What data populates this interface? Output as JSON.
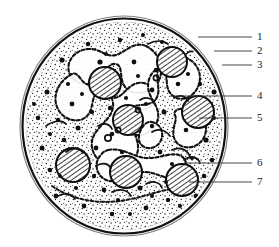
{
  "figure": {
    "kind": "cell-cross-section-diagram",
    "title_visible": false,
    "style": "black-and-white ink line drawing, stippled",
    "ink_color": "#1a1a1a",
    "background_color": "#ffffff"
  },
  "cell": {
    "shape": "circle",
    "center": {
      "x": 124,
      "y": 126
    },
    "radius_x": 104,
    "radius_y": 110,
    "membrane_layers": 3
  },
  "labels": [
    {
      "number": "1",
      "text_x": 259,
      "text_y": 32,
      "line_from_x": 198,
      "line_from_y": 37,
      "line_to_x": 252,
      "line_to_y": 37,
      "target": "outer-membrane"
    },
    {
      "number": "2",
      "text_x": 259,
      "text_y": 46,
      "line_from_x": 214,
      "line_from_y": 51,
      "line_to_x": 252,
      "line_to_y": 51,
      "target": "middle-membrane"
    },
    {
      "number": "3",
      "text_x": 259,
      "text_y": 60,
      "line_from_x": 222,
      "line_from_y": 65,
      "line_to_x": 252,
      "line_to_y": 65,
      "target": "inner-membrane"
    },
    {
      "number": "4",
      "text_x": 259,
      "text_y": 91,
      "line_from_x": 170,
      "line_from_y": 96,
      "line_to_x": 252,
      "line_to_y": 96,
      "target": "nucleus-lobe"
    },
    {
      "number": "5",
      "text_x": 259,
      "text_y": 113,
      "line_from_x": 199,
      "line_from_y": 118,
      "line_to_x": 252,
      "line_to_y": 118,
      "target": "large-hatched-granule"
    },
    {
      "number": "6",
      "text_x": 259,
      "text_y": 158,
      "line_from_x": 184,
      "line_from_y": 163,
      "line_to_x": 252,
      "line_to_y": 163,
      "target": "rod-shaped-inclusion"
    },
    {
      "number": "7",
      "text_x": 259,
      "text_y": 177,
      "line_from_x": 189,
      "line_from_y": 182,
      "line_to_x": 252,
      "line_to_y": 182,
      "target": "small-dark-granule"
    }
  ],
  "hatched_granules": [
    {
      "cx": 105,
      "cy": 83,
      "r": 16
    },
    {
      "cx": 172,
      "cy": 62,
      "r": 15
    },
    {
      "cx": 128,
      "cy": 120,
      "r": 15
    },
    {
      "cx": 198,
      "cy": 112,
      "r": 16
    },
    {
      "cx": 73,
      "cy": 165,
      "r": 17
    },
    {
      "cx": 126,
      "cy": 172,
      "r": 16
    },
    {
      "cx": 182,
      "cy": 180,
      "r": 16
    }
  ],
  "dark_granule_count": 62,
  "rod_inclusion_count": 14,
  "stipple_density": "high"
}
